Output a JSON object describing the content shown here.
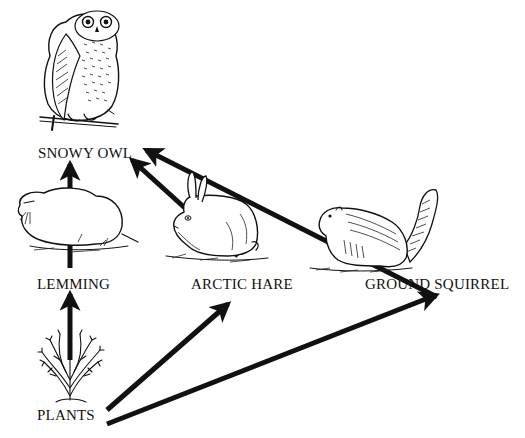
{
  "diagram": {
    "type": "food-web",
    "colors": {
      "ink": "#111111",
      "background": "#ffffff"
    },
    "nodes": [
      {
        "id": "owl",
        "label": "SNOWY OWL",
        "icon": "owl-illustration"
      },
      {
        "id": "lemming",
        "label": "LEMMING",
        "icon": "lemming-illustration"
      },
      {
        "id": "hare",
        "label": "ARCTIC HARE",
        "icon": "hare-illustration"
      },
      {
        "id": "squirrel",
        "label": "GROUND SQUIRREL",
        "icon": "squirrel-illustration"
      },
      {
        "id": "plants",
        "label": "PLANTS",
        "icon": "plant-illustration"
      }
    ],
    "edges": [
      {
        "from": "plants",
        "to": "lemming"
      },
      {
        "from": "plants",
        "to": "hare"
      },
      {
        "from": "plants",
        "to": "squirrel"
      },
      {
        "from": "lemming",
        "to": "owl"
      },
      {
        "from": "hare",
        "to": "owl"
      },
      {
        "from": "squirrel",
        "to": "owl"
      }
    ]
  }
}
